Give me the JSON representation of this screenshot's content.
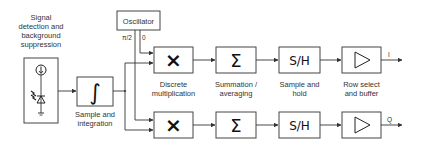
{
  "diagram": {
    "type": "block-diagram",
    "blocks": {
      "detector": {
        "label_lines": [
          "Signal",
          "detection and",
          "background",
          "suppression"
        ]
      },
      "integrator": {
        "symbol": "∫",
        "label_lines": [
          "Sample and",
          "integration"
        ]
      },
      "oscillator": {
        "label": "Oscillator",
        "outputs": {
          "quadrature": "π/2",
          "in_phase": "0"
        }
      },
      "multiplier": {
        "symbol": "×",
        "label_lines": [
          "Discrete",
          "multiplication"
        ]
      },
      "summation": {
        "symbol": "Σ",
        "label_lines": [
          "Summation /",
          "averaging"
        ]
      },
      "sample_hold": {
        "symbol": "S/H",
        "label_lines": [
          "Sample and",
          "hold"
        ]
      },
      "buffer": {
        "symbol": "▷",
        "label_lines": [
          "Row select",
          "and buffer"
        ]
      }
    },
    "outputs": {
      "top": "I",
      "bottom": "Q"
    },
    "colors": {
      "stroke": "#444444",
      "background": "#ffffff",
      "text": "#333333"
    }
  }
}
